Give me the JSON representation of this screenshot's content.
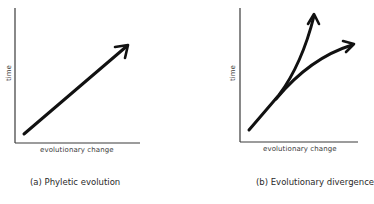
{
  "panels": [
    {
      "id": "a",
      "caption": "(a) Phyletic evolution",
      "x_axis_label": "evolutionary change",
      "y_axis_label": "time",
      "arrows": [
        {
          "name": "single-lineage",
          "shape": "straight"
        }
      ]
    },
    {
      "id": "b",
      "caption": "(b) Evolutionary divergence",
      "x_axis_label": "evolutionary change",
      "y_axis_label": "time",
      "arrows": [
        {
          "name": "branch-steep",
          "shape": "curve-up"
        },
        {
          "name": "branch-shallow",
          "shape": "curve-right"
        }
      ]
    }
  ],
  "colors": {
    "arrow": "#111111",
    "axis": "#3a3a3a",
    "text": "#2a2a2a"
  }
}
